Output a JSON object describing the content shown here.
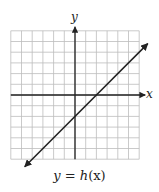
{
  "chart_data": {
    "type": "line",
    "title": "",
    "caption": "y = h(x)",
    "xlabel": "x",
    "ylabel": "y",
    "xlim": [
      -6,
      6
    ],
    "ylim": [
      -6,
      6
    ],
    "grid": true,
    "grid_step": 1,
    "tick_labels": false,
    "series": [
      {
        "name": "h(x)",
        "equation": "y = x - 2",
        "slope": 1,
        "y_intercept": -2,
        "x_intercept": 2,
        "x": [
          -4.7,
          6.8
        ],
        "y": [
          -6.7,
          4.8
        ],
        "arrows": "both"
      }
    ]
  },
  "labels": {
    "x_axis": "x",
    "y_axis": "y",
    "caption_lhs": "y",
    "caption_eq": " = ",
    "caption_fn": "h",
    "caption_arg": "(x)"
  }
}
